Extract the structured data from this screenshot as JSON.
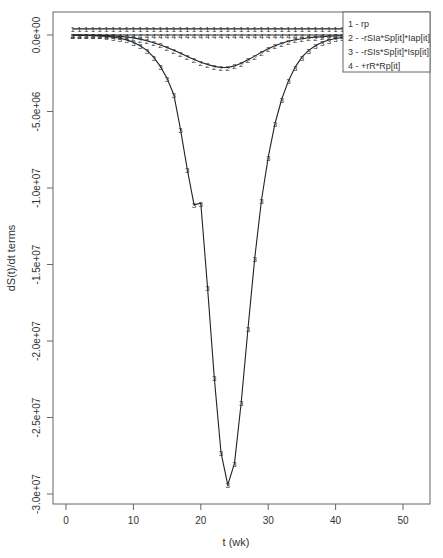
{
  "chart_data": {
    "type": "line",
    "title": "",
    "xlabel": "t (wk)",
    "ylabel": "dS(t)/dt terms",
    "xlim": [
      -2,
      54
    ],
    "ylim": [
      -31000000,
      1500000
    ],
    "xticks": [
      0,
      10,
      20,
      30,
      40,
      50
    ],
    "xtick_labels": [
      "0",
      "10",
      "20",
      "30",
      "40",
      "50"
    ],
    "yticks": [
      0,
      -5000000,
      -10000000,
      -15000000,
      -20000000,
      -25000000,
      -30000000
    ],
    "ytick_labels": [
      "0.0e+00",
      "-5.0e+06",
      "-1.0e+07",
      "-1.5e+07",
      "-2.0e+07",
      "-2.5e+07",
      "-3.0e+07"
    ],
    "grid": false,
    "legend_position": "top-right",
    "x": [
      1,
      2,
      3,
      4,
      5,
      6,
      7,
      8,
      9,
      10,
      11,
      12,
      13,
      14,
      15,
      16,
      17,
      18,
      19,
      20,
      21,
      22,
      23,
      24,
      25,
      26,
      27,
      28,
      29,
      30,
      31,
      32,
      33,
      34,
      35,
      36,
      37,
      38,
      39,
      40,
      41
    ],
    "series": [
      {
        "name": "1 - rp",
        "marker": "1",
        "values": [
          400000,
          400000,
          400000,
          400000,
          400000,
          400000,
          400000,
          400000,
          400000,
          400000,
          400000,
          400000,
          400000,
          400000,
          400000,
          400000,
          400000,
          400000,
          400000,
          400000,
          400000,
          400000,
          400000,
          400000,
          400000,
          400000,
          400000,
          400000,
          400000,
          400000,
          400000,
          400000,
          400000,
          400000,
          400000,
          400000,
          400000,
          400000,
          400000,
          400000,
          400000
        ]
      },
      {
        "name": "2 - -rSIa*Sp[it]*Iap[it]",
        "marker": "2",
        "values": [
          -5000,
          -8000,
          -12000,
          -18000,
          -27000,
          -40000,
          -60000,
          -90000,
          -130000,
          -190000,
          -270000,
          -370000,
          -500000,
          -650000,
          -820000,
          -1000000,
          -1200000,
          -1400000,
          -1600000,
          -1780000,
          -1930000,
          -2050000,
          -2120000,
          -2120000,
          -2020000,
          -1850000,
          -1620000,
          -1380000,
          -1130000,
          -900000,
          -700000,
          -540000,
          -410000,
          -310000,
          -240000,
          -180000,
          -140000,
          -110000,
          -85000,
          -65000,
          -50000
        ]
      },
      {
        "name": "3 - -rSIs*Sp[it]*Isp[it]",
        "marker": "3",
        "values": [
          -10000,
          -15000,
          -25000,
          -40000,
          -60000,
          -90000,
          -140000,
          -210000,
          -320000,
          -470000,
          -700000,
          -1000000,
          -1450000,
          -2050000,
          -2850000,
          -3900000,
          -6200000,
          -8800000,
          -11100000,
          -11000000,
          -16500000,
          -22400000,
          -27300000,
          -29400000,
          -28000000,
          -24000000,
          -19200000,
          -14600000,
          -10800000,
          -8000000,
          -5800000,
          -4200000,
          -3000000,
          -2100000,
          -1450000,
          -1000000,
          -700000,
          -480000,
          -330000,
          -230000,
          -160000
        ]
      },
      {
        "name": "4 - +rR*Rp[it]",
        "marker": "4",
        "values": [
          0,
          0,
          0,
          0,
          0,
          0,
          0,
          0,
          0,
          0,
          0,
          0,
          0,
          0,
          0,
          0,
          0,
          0,
          0,
          0,
          0,
          0,
          0,
          0,
          0,
          0,
          0,
          0,
          0,
          0,
          0,
          0,
          0,
          0,
          0,
          0,
          0,
          0,
          0,
          0,
          0
        ]
      }
    ]
  },
  "legend": {
    "items": [
      "1 - rp",
      "2 - -rSIa*Sp[it]*Iap[it]",
      "3 - -rSIs*Sp[it]*Isp[it]",
      "4 - +rR*Rp[it]"
    ]
  },
  "axes": {
    "xlabel": "t (wk)",
    "ylabel": "dS(t)/dt terms"
  },
  "colors": {
    "line": "#222222",
    "axis": "#555555",
    "text": "#333333",
    "background": "#ffffff"
  }
}
